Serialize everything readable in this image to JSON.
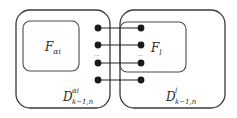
{
  "diagram": {
    "left_outer": {
      "label_base": "D",
      "label_sup": "αi",
      "label_sub": "k−1,n"
    },
    "left_inner": {
      "label_base": "F",
      "label_sub": "αi"
    },
    "right_outer": {
      "label_base": "D",
      "label_sup": "l",
      "label_sub": "k−1,n"
    },
    "right_inner": {
      "label_base": "F",
      "label_sub": "l"
    },
    "ellipsis": "...",
    "connections": [
      {
        "from": "left-dot-1",
        "to": "right-dot-1"
      },
      {
        "from": "left-dot-2",
        "to": "right-dot-2"
      },
      {
        "from": "left-dot-3",
        "to": "right-dot-3"
      },
      {
        "from": "left-dot-4",
        "to": "right-dot-4"
      }
    ]
  }
}
